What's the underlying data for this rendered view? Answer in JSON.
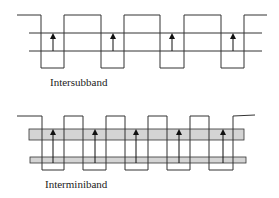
{
  "diagrams": [
    {
      "id": "intersubband",
      "label": "Intersubband",
      "profile": "17,15 41,15 41,68 64,68 64,15 101,15 101,68 124,68 124,15 160,15 160,68 184,68 184,15 221,15 221,68 244,68 244,15 267,15",
      "levels": [
        {
          "y": 33,
          "x1": 29,
          "x2": 262
        },
        {
          "y": 51,
          "x1": 29,
          "x2": 262
        }
      ],
      "arrows": [
        {
          "x": 53,
          "y1": 51,
          "y2": 34
        },
        {
          "x": 113,
          "y1": 51,
          "y2": 34
        },
        {
          "x": 172,
          "y1": 51,
          "y2": 34
        },
        {
          "x": 233,
          "y1": 51,
          "y2": 34
        }
      ],
      "label_pos": {
        "x": 50,
        "y": 76
      }
    },
    {
      "id": "interminiband",
      "label": "Interminiband",
      "profile": "17,116 42,116 42,170 64,170 64,116 83,116 83,170 106,170 106,116 125,116 125,170 148,170 148,116 167,116 167,170 190,170 190,116 209,116 209,170 233,170 233,116 255,115",
      "bands": [
        {
          "x": 29,
          "y": 129,
          "w": 215,
          "h": 11
        },
        {
          "x": 30,
          "y": 157,
          "w": 216,
          "h": 6
        }
      ],
      "arrows": [
        {
          "x": 53,
          "y1": 163,
          "y2": 130
        },
        {
          "x": 95,
          "y1": 163,
          "y2": 130
        },
        {
          "x": 136,
          "y1": 163,
          "y2": 130
        },
        {
          "x": 179,
          "y1": 163,
          "y2": 130
        },
        {
          "x": 223,
          "y1": 163,
          "y2": 130
        }
      ],
      "label_pos": {
        "x": 45,
        "y": 178
      }
    }
  ],
  "colors": {
    "line": "#333333",
    "band_fill": "#d4d4d4",
    "arrow": "#111111"
  }
}
